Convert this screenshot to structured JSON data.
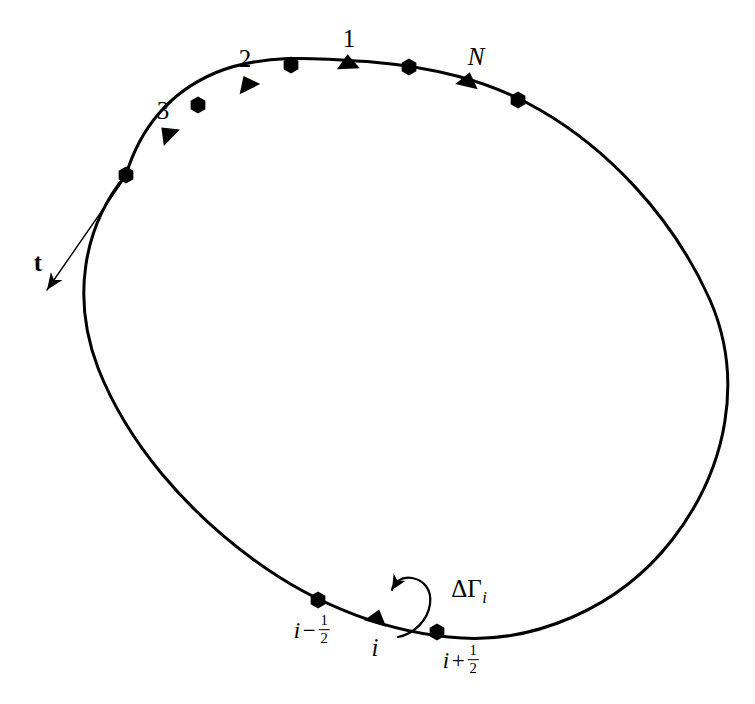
{
  "figure": {
    "background_color": "#ffffff",
    "stroke_color": "#000000",
    "curve_stroke_width": 3.0
  },
  "curve": {
    "name": "closed-contour",
    "path": "M 126 175 C 140 128 170 92 215 73 C 262 53 318 58 372 62 C 430 67 487 79 540 110 C 606 148 672 215 710 300 C 744 378 728 468 672 540 C 616 612 530 642 462 638 C 392 634 318 607 254 560 C 186 510 128 444 98 368 C 72 300 82 228 126 175 Z",
    "closed": true
  },
  "markers": {
    "hexagon": {
      "icon": "hexagon-node-marker",
      "fill": "#000000",
      "radius": 8.5
    },
    "triangle": {
      "icon": "triangle-node-marker",
      "fill": "#000000",
      "size": 11.5
    },
    "nodes": [
      {
        "id": "hex-start",
        "shape": "hexagon",
        "x": 126,
        "y": 175,
        "angle": 0,
        "label": ""
      },
      {
        "id": "tri-3",
        "shape": "triangle",
        "x": 167,
        "y": 133,
        "angle": -46,
        "label": "3"
      },
      {
        "id": "hex-a",
        "shape": "hexagon",
        "x": 198,
        "y": 105,
        "angle": 0,
        "label": ""
      },
      {
        "id": "tri-2",
        "shape": "triangle",
        "x": 247,
        "y": 83,
        "angle": -26,
        "label": "2"
      },
      {
        "id": "hex-b",
        "shape": "hexagon",
        "x": 291,
        "y": 65,
        "angle": 0,
        "label": ""
      },
      {
        "id": "tri-1",
        "shape": "triangle",
        "x": 348,
        "y": 62,
        "angle": -3,
        "label": "1"
      },
      {
        "id": "hex-c",
        "shape": "hexagon",
        "x": 409,
        "y": 67,
        "angle": 0,
        "label": ""
      },
      {
        "id": "tri-N",
        "shape": "triangle",
        "x": 468,
        "y": 80,
        "angle": 13,
        "label": "N"
      },
      {
        "id": "hex-d",
        "shape": "hexagon",
        "x": 518,
        "y": 100,
        "angle": 0,
        "label": ""
      },
      {
        "id": "hex-i-minus",
        "shape": "hexagon",
        "x": 318,
        "y": 600,
        "angle": 0,
        "label": ""
      },
      {
        "id": "tri-i",
        "shape": "triangle",
        "x": 377,
        "y": 617,
        "angle": 16,
        "label": ""
      },
      {
        "id": "hex-i-plus",
        "shape": "hexagon",
        "x": 437,
        "y": 632,
        "angle": 0,
        "label": ""
      }
    ]
  },
  "labels": {
    "node_1": {
      "text": "1",
      "x": 349,
      "y": 38,
      "style": "num"
    },
    "node_2": {
      "text": "2",
      "x": 245,
      "y": 58,
      "style": "num"
    },
    "node_3": {
      "text": "3",
      "x": 163,
      "y": 110,
      "style": "num"
    },
    "node_N": {
      "text": "N",
      "x": 476,
      "y": 56,
      "style": "var"
    },
    "tangent": {
      "text": "t",
      "x": 38,
      "y": 262,
      "style": "vec"
    },
    "i_minus_half": {
      "base": "i",
      "op": "−",
      "num": "1",
      "den": "2",
      "x": 312,
      "y": 630,
      "style": "frac"
    },
    "i_node": {
      "text": "i",
      "x": 375,
      "y": 647,
      "style": "var"
    },
    "i_plus_half": {
      "base": "i",
      "op": "+",
      "num": "1",
      "den": "2",
      "x": 461,
      "y": 660,
      "style": "frac"
    },
    "circulation": {
      "delta": "Δ",
      "gamma": "Γ",
      "sub": "i",
      "x": 469,
      "y": 591,
      "style": "gamma"
    }
  },
  "arrows": {
    "tangent_vector": {
      "name": "tangent-vector-arrow",
      "path": "M 126 176 L 47 290",
      "tip_x": 45,
      "tip_y": 292,
      "stroke_width": 1.4,
      "head_length": 17,
      "head_width": 7
    },
    "circulation_loop": {
      "name": "circulation-loop-arrow",
      "path": "M 398 637 C 414 634 428 620 430 604 C 432 590 424 580 412 578 C 401 576 393 583 392 590",
      "tip_x": 385,
      "tip_y": 588,
      "stroke_width": 2.2,
      "head_length": 15,
      "head_width": 7
    }
  }
}
